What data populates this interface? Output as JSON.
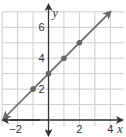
{
  "chart_data": {
    "type": "line",
    "title": "",
    "xlabel": "x",
    "ylabel": "y",
    "xlim": [
      -3,
      5
    ],
    "ylim": [
      -1,
      7
    ],
    "grid": true,
    "x_ticks": [
      -2,
      2,
      4
    ],
    "x_tick_labels": [
      "−2",
      "2",
      "4"
    ],
    "y_ticks": [
      2,
      4,
      6
    ],
    "y_tick_labels": [
      "2",
      "4",
      "6"
    ],
    "series": [
      {
        "name": "y = x + 3",
        "line": {
          "from": [
            -2.9,
            0.1
          ],
          "to": [
            4,
            7
          ],
          "arrows": "both"
        },
        "points": [
          {
            "x": -1,
            "y": 2
          },
          {
            "x": 0,
            "y": 3
          },
          {
            "x": 1,
            "y": 4
          },
          {
            "x": 2,
            "y": 5
          }
        ]
      }
    ],
    "colors": {
      "grid": "#cccccc",
      "axes": "#333333",
      "line": "#666666",
      "points": "#666666"
    }
  }
}
